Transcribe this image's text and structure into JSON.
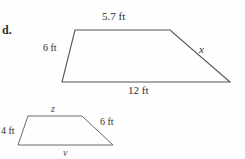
{
  "part_label": "d.",
  "figures": {
    "top_trapezoid": {
      "name": "large-trapezoid",
      "vertices": {
        "top_left": [
          75,
          30
        ],
        "top_right": [
          170,
          30
        ],
        "bottom_right": [
          230,
          82
        ],
        "bottom_left": [
          62,
          82
        ]
      },
      "labels": {
        "top_side": "5.7 ft",
        "left_side": "6 ft",
        "right_side": "x",
        "bottom_side": "12 ft"
      }
    },
    "bottom_trapezoid": {
      "name": "small-trapezoid",
      "vertices": {
        "top_left": [
          28,
          116
        ],
        "top_right": [
          82,
          116
        ],
        "bottom_right": [
          113,
          145
        ],
        "bottom_left": [
          18,
          145
        ]
      },
      "labels": {
        "top_side": "z",
        "left_side": "4 ft",
        "right_side": "6 ft",
        "bottom_side": "v"
      }
    }
  },
  "colors": {
    "stroke": "#555555",
    "text": "#2d2d2d",
    "background": "#fefefe"
  }
}
